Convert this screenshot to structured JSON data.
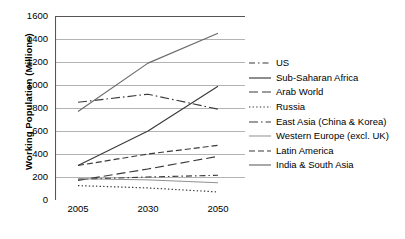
{
  "chart_data": {
    "type": "line",
    "title": "",
    "xlabel": "",
    "ylabel": "Working Population (Millions)",
    "x": [
      2005,
      2030,
      2050
    ],
    "xticklabels": [
      "2005",
      "2030",
      "2050"
    ],
    "ylim": [
      0,
      1600
    ],
    "yticks": [
      0,
      200,
      400,
      600,
      800,
      1000,
      1200,
      1400,
      1600
    ],
    "yticklabels": [
      "0",
      "200",
      "400",
      "600",
      "800",
      "1000",
      "1200",
      "1400",
      "1600"
    ],
    "grid": true,
    "legend_position": "right",
    "series": [
      {
        "name": "US",
        "values": [
          180,
          200,
          215
        ],
        "style": "dashdot-short",
        "color": "#3a3a3a"
      },
      {
        "name": "Sub-Saharan Africa",
        "values": [
          300,
          600,
          990
        ],
        "style": "solid",
        "color": "#3a3a3a"
      },
      {
        "name": "Arab World",
        "values": [
          170,
          270,
          380
        ],
        "style": "dashed-long",
        "color": "#3a3a3a"
      },
      {
        "name": "Russia",
        "values": [
          125,
          105,
          70
        ],
        "style": "dotted",
        "color": "#3a3a3a"
      },
      {
        "name": "East Asia (China & Korea)",
        "values": [
          850,
          920,
          790
        ],
        "style": "dashdot",
        "color": "#3a3a3a"
      },
      {
        "name": "Western Europe (excl. UK)",
        "values": [
          185,
          175,
          150
        ],
        "style": "solid-thin",
        "color": "#8a8a8a"
      },
      {
        "name": "Latin America",
        "values": [
          300,
          400,
          475
        ],
        "style": "dashed",
        "color": "#3a3a3a"
      },
      {
        "name": "India & South Asia",
        "values": [
          770,
          1190,
          1450
        ],
        "style": "solid",
        "color": "#6a6a6a"
      }
    ]
  },
  "axis": {
    "y_title": "Working Population (Millions)",
    "y_labels": [
      "1600",
      "1400",
      "1200",
      "1000",
      "800",
      "600",
      "400",
      "200",
      "0"
    ],
    "x_labels": [
      "2005",
      "2030",
      "2050"
    ]
  },
  "legend": {
    "items": [
      {
        "label": "US"
      },
      {
        "label": "Sub-Saharan Africa"
      },
      {
        "label": "Arab World"
      },
      {
        "label": "Russia"
      },
      {
        "label": "East Asia (China & Korea)"
      },
      {
        "label": "Western Europe (excl. UK)"
      },
      {
        "label": "Latin America"
      },
      {
        "label": "India & South Asia"
      }
    ]
  }
}
